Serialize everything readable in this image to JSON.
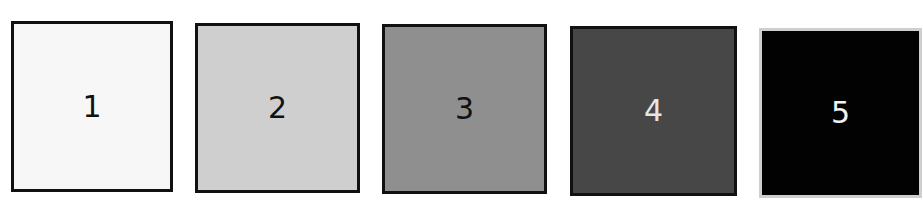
{
  "swatches": [
    {
      "label": "1",
      "fill": "#f7f7f7",
      "text_color": "#111111"
    },
    {
      "label": "2",
      "fill": "#cfcfcf",
      "text_color": "#111111"
    },
    {
      "label": "3",
      "fill": "#8f8f8f",
      "text_color": "#111111"
    },
    {
      "label": "4",
      "fill": "#474747",
      "text_color": "#e6e6e6"
    },
    {
      "label": "5",
      "fill": "#020202",
      "text_color": "#f2f2f2"
    }
  ]
}
